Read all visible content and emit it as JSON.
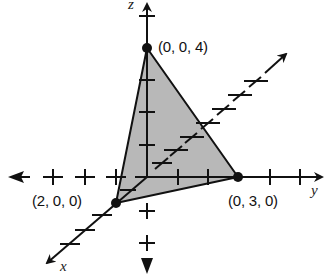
{
  "diagram": {
    "type": "3d-coordinate-plane-triangle",
    "axes": {
      "x_label": "x",
      "y_label": "y",
      "z_label": "z"
    },
    "vertices": [
      {
        "label": "(0, 0, 4)",
        "coords": [
          0,
          0,
          4
        ]
      },
      {
        "label": "(2, 0, 0)",
        "coords": [
          2,
          0,
          0
        ]
      },
      {
        "label": "(0, 3, 0)",
        "coords": [
          0,
          3,
          0
        ]
      }
    ],
    "colors": {
      "fill": "#b8b8b8",
      "stroke": "#111111",
      "background": "#ffffff"
    }
  }
}
